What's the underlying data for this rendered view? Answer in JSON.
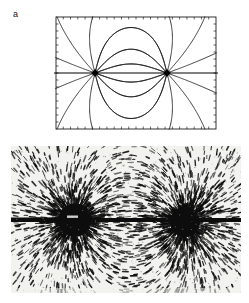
{
  "figure": {
    "panel_label": "a",
    "caption_present": false,
    "background_color": "#ffffff",
    "ink_color": "#000000"
  },
  "field_plot": {
    "name": "magnetic-field-line-diagram",
    "frame": {
      "x": 2,
      "y": 2,
      "width": 160,
      "height": 112,
      "border_color": "#000000",
      "border_width": 0.8,
      "ticks_per_side_horizontal": 22,
      "ticks_per_side_vertical": 16,
      "tick_length": 2.5
    },
    "axis_line": {
      "description": "horizontal axis line through both poles, extends past right frame edge",
      "y": 58,
      "x_start": 0,
      "x_end": 164,
      "color": "#000000",
      "width": 1.1
    },
    "poles": [
      {
        "label": "left-pole",
        "x": 41,
        "y": 58,
        "marker": "filled-diamond",
        "size": 4
      },
      {
        "label": "right-pole",
        "x": 113,
        "y": 58,
        "marker": "filled-diamond",
        "size": 4
      }
    ],
    "line_color": "#1a1a1a",
    "line_width": 0.85,
    "loop_curves": [
      {
        "name": "inner-loop-upper",
        "apex_offset": -18
      },
      {
        "name": "mid-loop-upper",
        "apex_offset": -33
      },
      {
        "name": "inner-loop-lower",
        "apex_offset": 18
      },
      {
        "name": "mid-loop-lower",
        "apex_offset": 33
      }
    ],
    "radial_angles_deg": [
      20,
      48,
      76,
      104,
      132,
      160,
      200,
      228,
      256,
      284,
      312,
      340
    ],
    "description": "Field lines of two opposite point poles: closed loops between the poles plus lines radiating outward to the frame edges."
  },
  "filings_photo": {
    "name": "iron-filings-photograph",
    "frame": {
      "x": 0,
      "y": 0,
      "width": 230,
      "height": 147
    },
    "background_color": "#f2f2ef",
    "filing_color": "#0d0d0d",
    "poles": [
      {
        "label": "left-pole-blob",
        "x": 64,
        "y": 74,
        "radius": 17
      },
      {
        "label": "right-pole-blob",
        "x": 174,
        "y": 76,
        "radius": 15
      }
    ],
    "bar_magnet": {
      "description": "dark horizontal bar through both poles extending to left and right edges",
      "y": 74,
      "thickness": 4
    },
    "filing_count": 2000,
    "description": "Photograph of iron filings on paper revealing the field pattern of two opposite magnetic poles."
  }
}
